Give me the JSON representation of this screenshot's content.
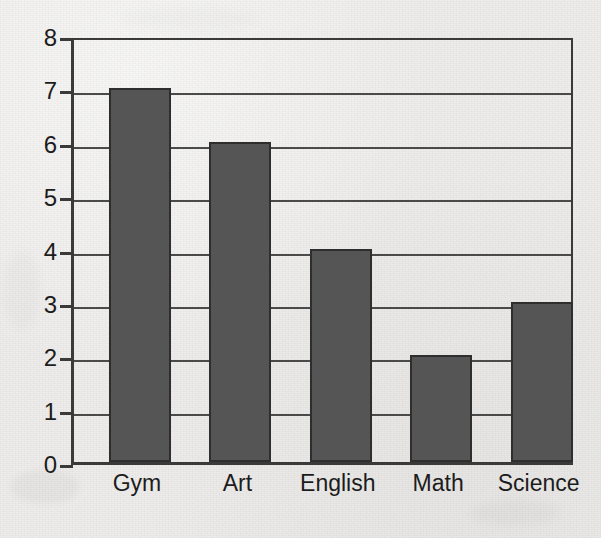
{
  "chart_data": {
    "type": "bar",
    "title": "",
    "subtitle": "",
    "xlabel": "",
    "ylabel": "",
    "categories": [
      "Gym",
      "Art",
      "English",
      "Math",
      "Science"
    ],
    "values": [
      7,
      6,
      4,
      2,
      3
    ],
    "ylim": [
      0,
      8
    ],
    "ytick_labels": [
      "0",
      "1",
      "2",
      "3",
      "4",
      "5",
      "6",
      "7",
      "8"
    ],
    "ytick_values": [
      0,
      1,
      2,
      3,
      4,
      5,
      6,
      7,
      8
    ],
    "grid": "horizontal",
    "legend": "none",
    "annotations": [],
    "colors": {
      "bar_fill": "#555555",
      "bar_outline": "#2e2e2e",
      "axis": "#3a3a3a",
      "gridline": "#4a4a4a",
      "background": "#eeedeb",
      "text": "#1c1c1c"
    }
  }
}
